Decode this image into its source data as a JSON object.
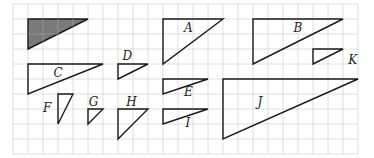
{
  "grid": {
    "origin_x": 13,
    "origin_y": 4,
    "cell": 15,
    "cols": 23,
    "rows": 10,
    "line_color": "#d6d6d6",
    "stroke_color": "#1a1a1a",
    "shade_color": "#7a7a7a"
  },
  "triangles": [
    {
      "id": "shaded",
      "label": "",
      "points": [
        [
          1,
          1
        ],
        [
          5,
          1
        ],
        [
          1,
          3
        ]
      ],
      "shaded": true,
      "label_pos": null
    },
    {
      "id": "A",
      "label": "A",
      "points": [
        [
          10,
          1
        ],
        [
          14,
          1
        ],
        [
          10,
          4
        ]
      ],
      "shaded": false,
      "label_pos": [
        11.4,
        1.85
      ]
    },
    {
      "id": "B",
      "label": "B",
      "points": [
        [
          16,
          1
        ],
        [
          22,
          1
        ],
        [
          16,
          4
        ]
      ],
      "shaded": false,
      "label_pos": [
        18.7,
        1.85
      ]
    },
    {
      "id": "K",
      "label": "K",
      "points": [
        [
          20,
          3
        ],
        [
          22,
          3
        ],
        [
          20,
          4
        ]
      ],
      "shaded": false,
      "label_pos": [
        22.35,
        4.0
      ]
    },
    {
      "id": "C",
      "label": "C",
      "points": [
        [
          1,
          4
        ],
        [
          6,
          4
        ],
        [
          1,
          6
        ]
      ],
      "shaded": false,
      "label_pos": [
        2.7,
        4.85
      ]
    },
    {
      "id": "D",
      "label": "D",
      "points": [
        [
          7,
          4
        ],
        [
          9,
          4
        ],
        [
          7,
          5
        ]
      ],
      "shaded": false,
      "label_pos": [
        7.3,
        3.75
      ]
    },
    {
      "id": "E",
      "label": "E",
      "points": [
        [
          10,
          5
        ],
        [
          13,
          5
        ],
        [
          10,
          6
        ]
      ],
      "shaded": false,
      "label_pos": [
        11.4,
        6.15
      ]
    },
    {
      "id": "I",
      "label": "I",
      "points": [
        [
          10,
          7
        ],
        [
          13,
          7
        ],
        [
          10,
          8
        ]
      ],
      "shaded": false,
      "label_pos": [
        11.5,
        8.2
      ]
    },
    {
      "id": "J",
      "label": "J",
      "points": [
        [
          14,
          5
        ],
        [
          23,
          5
        ],
        [
          14,
          9
        ]
      ],
      "shaded": false,
      "label_pos": [
        16.3,
        6.8
      ]
    },
    {
      "id": "F",
      "label": "F",
      "points": [
        [
          3,
          6
        ],
        [
          4,
          6
        ],
        [
          3,
          8
        ]
      ],
      "shaded": false,
      "label_pos": [
        2.0,
        7.2
      ]
    },
    {
      "id": "G",
      "label": "G",
      "points": [
        [
          5,
          7
        ],
        [
          6,
          7
        ],
        [
          5,
          8
        ]
      ],
      "shaded": false,
      "label_pos": [
        5.05,
        6.8
      ]
    },
    {
      "id": "H",
      "label": "H",
      "points": [
        [
          7,
          7
        ],
        [
          9,
          7
        ],
        [
          7,
          9
        ]
      ],
      "shaded": false,
      "label_pos": [
        7.55,
        6.8
      ]
    }
  ]
}
